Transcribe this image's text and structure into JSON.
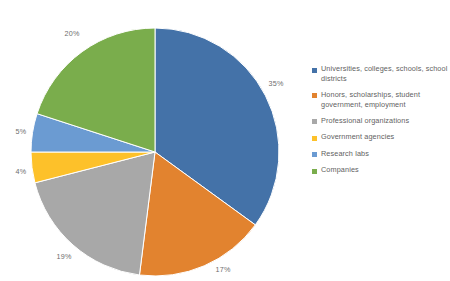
{
  "chart_data": {
    "type": "pie",
    "title": "",
    "legend_position": "right",
    "start_angle_deg": 0,
    "direction": "clockwise",
    "categories": [
      "Universities, colleges, schools, school districts",
      "Honors, scholarships, student government, employment",
      "Professional organizations",
      "Government agencies",
      "Research labs",
      "Companies"
    ],
    "values": [
      35,
      17,
      19,
      4,
      5,
      20
    ],
    "value_unit": "%",
    "colors": [
      "#4472a8",
      "#e2832f",
      "#a8a8a8",
      "#fdc12a",
      "#6b9bd2",
      "#7aad4c"
    ],
    "slices": [
      {
        "label": "Universities, colleges, schools, school districts",
        "value": 35,
        "display": "35%",
        "color": "#4472a8",
        "label_x": 276,
        "label_y": 83
      },
      {
        "label": "Honors, scholarships, student government, employment",
        "value": 17,
        "display": "17%",
        "color": "#e2832f",
        "label_x": 223,
        "label_y": 269
      },
      {
        "label": "Professional organizations",
        "value": 19,
        "display": "19%",
        "color": "#a8a8a8",
        "label_x": 64,
        "label_y": 256
      },
      {
        "label": "Government agencies",
        "value": 4,
        "display": "4%",
        "color": "#fdc12a",
        "label_x": 21,
        "label_y": 171
      },
      {
        "label": "Research labs",
        "value": 5,
        "display": "5%",
        "color": "#6b9bd2",
        "label_x": 21,
        "label_y": 131
      },
      {
        "label": "Companies",
        "value": 20,
        "display": "20%",
        "color": "#7aad4c",
        "label_x": 72,
        "label_y": 33
      }
    ]
  },
  "legend": {
    "items": [
      {
        "label": "Universities, colleges, schools, school districts",
        "color": "#4472a8"
      },
      {
        "label": "Honors, scholarships, student government, employment",
        "color": "#e2832f"
      },
      {
        "label": "Professional organizations",
        "color": "#a8a8a8"
      },
      {
        "label": "Government agencies",
        "color": "#fdc12a"
      },
      {
        "label": "Research labs",
        "color": "#6b9bd2"
      },
      {
        "label": "Companies",
        "color": "#7aad4c"
      }
    ]
  },
  "geometry": {
    "center_x": 155,
    "center_y": 152,
    "radius": 124,
    "separator_color": "#ffffff"
  }
}
